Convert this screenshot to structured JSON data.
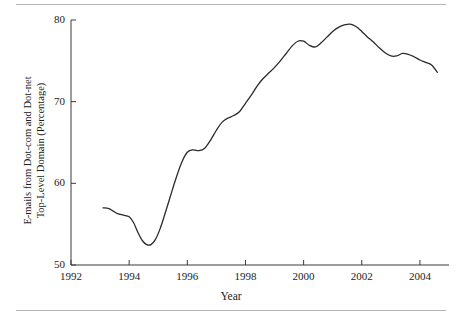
{
  "chart_data": {
    "type": "line",
    "title": "",
    "subtitle": "",
    "xlabel": "Year",
    "ylabel_line1": "E-mails from Dot-com and Dot-net",
    "ylabel_line2": "Top-Level Domain (Percentage)",
    "xlim": [
      1992,
      2005
    ],
    "ylim": [
      50,
      80
    ],
    "xticks": [
      "1992",
      "1994",
      "1996",
      "1998",
      "2000",
      "2002",
      "2004"
    ],
    "xtick_values": [
      1992,
      1994,
      1996,
      1998,
      2000,
      2002,
      2004
    ],
    "yticks": [
      "50",
      "60",
      "70",
      "80"
    ],
    "ytick_values": [
      50,
      60,
      70,
      80
    ],
    "grid": false,
    "legend": "none",
    "line_color": "#2b2b2b",
    "series": [
      {
        "name": "Dot-com and Dot-net share of e-mail",
        "x": [
          1993.1,
          1993.3,
          1993.45,
          1993.6,
          1993.8,
          1994.0,
          1994.15,
          1994.3,
          1994.45,
          1994.6,
          1994.75,
          1994.9,
          1995.05,
          1995.2,
          1995.4,
          1995.6,
          1995.8,
          1996.0,
          1996.2,
          1996.4,
          1996.6,
          1996.8,
          1997.0,
          1997.2,
          1997.4,
          1997.6,
          1997.8,
          1998.0,
          1998.2,
          1998.4,
          1998.6,
          1998.8,
          1999.0,
          1999.2,
          1999.4,
          1999.6,
          1999.8,
          2000.0,
          2000.2,
          2000.4,
          2000.6,
          2000.8,
          2001.0,
          2001.2,
          2001.4,
          2001.6,
          2001.8,
          2002.0,
          2002.2,
          2002.4,
          2002.6,
          2002.8,
          2003.0,
          2003.2,
          2003.4,
          2003.6,
          2003.8,
          2004.0,
          2004.2,
          2004.4,
          2004.6
        ],
        "y": [
          57.0,
          56.9,
          56.6,
          56.3,
          56.1,
          55.9,
          55.2,
          54.0,
          53.0,
          52.5,
          52.5,
          53.1,
          54.3,
          55.9,
          58.2,
          60.5,
          62.5,
          63.8,
          64.1,
          64.0,
          64.3,
          65.3,
          66.5,
          67.5,
          68.0,
          68.3,
          68.8,
          69.8,
          70.8,
          71.9,
          72.8,
          73.5,
          74.2,
          75.0,
          75.9,
          76.8,
          77.4,
          77.4,
          76.9,
          76.7,
          77.2,
          77.9,
          78.6,
          79.1,
          79.4,
          79.5,
          79.2,
          78.6,
          77.9,
          77.3,
          76.6,
          76.0,
          75.6,
          75.6,
          75.9,
          75.8,
          75.5,
          75.1,
          74.8,
          74.5,
          73.6
        ]
      }
    ]
  },
  "axes": {
    "x_title": "Year",
    "y_title_line1": "E-mails from Dot-com and Dot-net",
    "y_title_line2": "Top-Level Domain (Percentage)"
  },
  "ticks": {
    "y": [
      "80",
      "70",
      "60",
      "50"
    ],
    "x": [
      "1992",
      "1994",
      "1996",
      "1998",
      "2000",
      "2002",
      "2004"
    ]
  }
}
